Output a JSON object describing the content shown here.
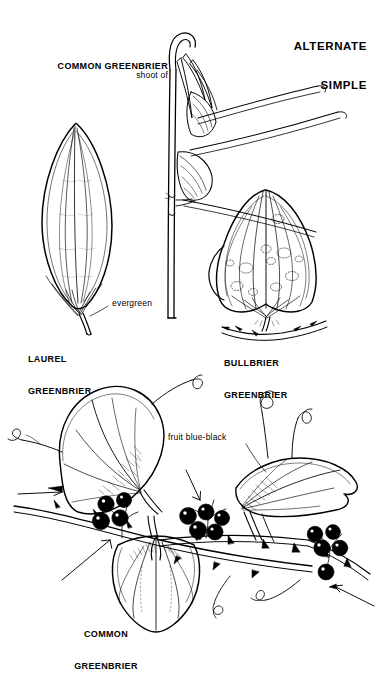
{
  "page": {
    "background_color": "#ffffff",
    "ink_color": "#000000",
    "title_block": {
      "line1": "ALTERNATE",
      "line2": "SIMPLE"
    }
  },
  "figures": {
    "shoot": {
      "annotation_line1": "shoot of",
      "annotation_line2": "COMMON GREENBRIER",
      "icon": "greenbrier-shoot-icon"
    },
    "laurel": {
      "caption_line1": "LAUREL",
      "caption_line2": "GREENBRIER",
      "annotation": "evergreen",
      "icon": "laurel-leaf-icon"
    },
    "bullbrier": {
      "caption_line1": "BULLBRIER",
      "caption_line2": "GREENBRIER",
      "icon": "bullbrier-leaf-icon"
    },
    "common": {
      "caption_line1": "COMMON",
      "caption_line2": "GREENBRIER",
      "annotation": "fruit blue-black",
      "icon": "common-greenbrier-vine-icon"
    }
  }
}
